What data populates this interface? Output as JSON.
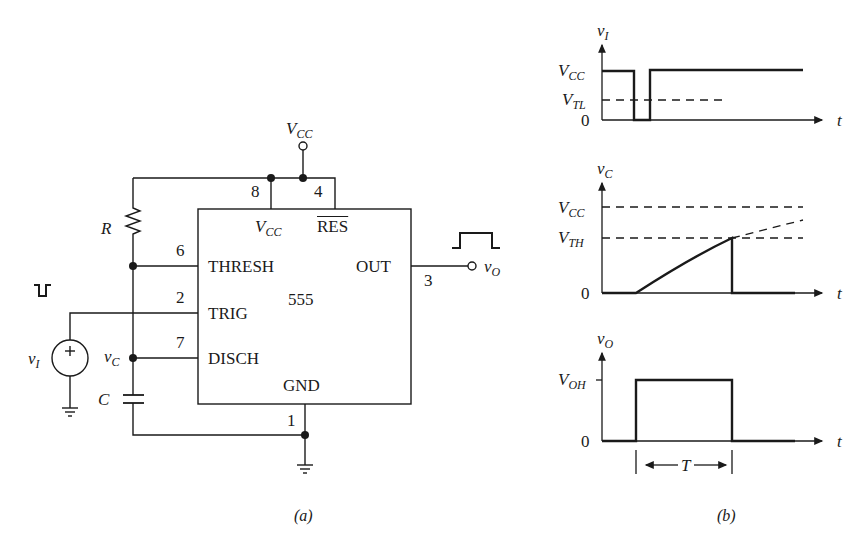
{
  "figure_a": {
    "caption": "(a)",
    "chip": {
      "name": "555",
      "pins": {
        "vcc": {
          "number": "8",
          "label_main": "V",
          "label_sub": "CC"
        },
        "reset": {
          "number": "4",
          "label": "RES"
        },
        "thresh": {
          "number": "6",
          "label": "THRESH"
        },
        "trig": {
          "number": "2",
          "label": "TRIG"
        },
        "disch": {
          "number": "7",
          "label": "DISCH"
        },
        "gnd": {
          "number": "1",
          "label": "GND"
        },
        "out": {
          "number": "3",
          "label": "OUT"
        }
      }
    },
    "supply": {
      "label_main": "V",
      "label_sub": "CC"
    },
    "resistor": {
      "label": "R"
    },
    "capacitor": {
      "label": "C"
    },
    "node_vc": {
      "label_main": "v",
      "label_sub": "C"
    },
    "source": {
      "label_main": "v",
      "label_sub": "I",
      "polarity": "+"
    },
    "output": {
      "label_main": "v",
      "label_sub": "O"
    }
  },
  "figure_b": {
    "caption": "(b)",
    "plots": [
      {
        "ylabel_main": "v",
        "ylabel_sub": "I",
        "xlabel": "t",
        "ticks": [
          {
            "main": "V",
            "sub": "CC"
          },
          {
            "main": "V",
            "sub": "TL"
          },
          {
            "main": "0",
            "sub": ""
          }
        ]
      },
      {
        "ylabel_main": "v",
        "ylabel_sub": "C",
        "xlabel": "t",
        "ticks": [
          {
            "main": "V",
            "sub": "CC"
          },
          {
            "main": "V",
            "sub": "TH"
          },
          {
            "main": "0",
            "sub": ""
          }
        ]
      },
      {
        "ylabel_main": "v",
        "ylabel_sub": "O",
        "xlabel": "t",
        "ticks": [
          {
            "main": "V",
            "sub": "OH"
          },
          {
            "main": "0",
            "sub": ""
          }
        ],
        "interval_label": "T"
      }
    ]
  },
  "colors": {
    "ink": "#1a1a1a",
    "background": "#ffffff"
  }
}
